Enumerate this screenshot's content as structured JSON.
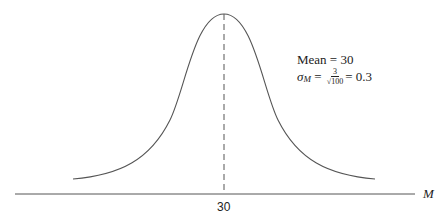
{
  "diagram": {
    "type": "normal-distribution-curve",
    "axis_label": "M",
    "center_tick_label": "30",
    "annotation": {
      "mean_text": "Mean  =  30",
      "sigma_symbol": "σ",
      "sigma_subscript": "M",
      "equals": " = ",
      "fraction_numerator": "3",
      "fraction_denominator": "√100",
      "result": "=  0.3"
    },
    "colors": {
      "line": "#555555",
      "text": "#222222",
      "background": "#ffffff"
    }
  }
}
